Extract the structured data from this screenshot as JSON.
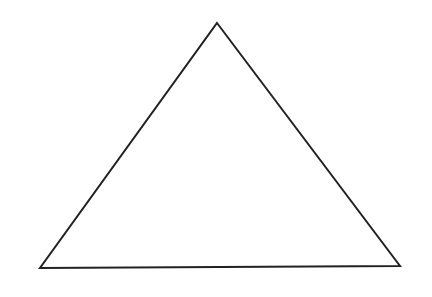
{
  "canvas": {
    "width": 432,
    "height": 297,
    "background": "#ffffff"
  },
  "shape": {
    "type": "triangle",
    "stroke": "#222222",
    "stroke_width": 2,
    "fill": "none",
    "vertices": {
      "apex": [
        217,
        23
      ],
      "bottom_left": [
        40,
        268
      ],
      "bottom_right": [
        400,
        266
      ]
    }
  }
}
